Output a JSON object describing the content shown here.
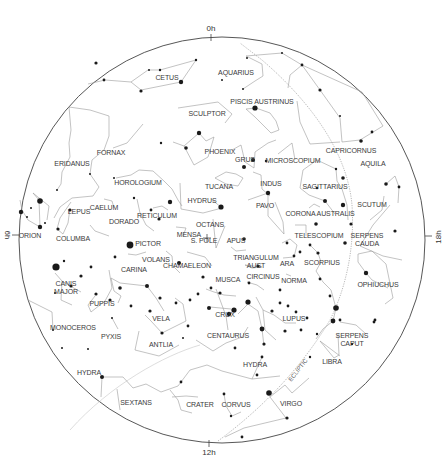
{
  "chart": {
    "center_marker": "S. POLE",
    "hour_labels": {
      "top": "0h",
      "right": "18h",
      "bottom": "12h",
      "left": "6h"
    },
    "ecliptic_label": "ECLIPTIC",
    "colors": {
      "line": "#9a9a9a",
      "star": "#1a1a1a",
      "border": "#444444",
      "text": "#3a3a3a"
    }
  },
  "constellations": [
    {
      "name": "CETUS",
      "x": 167,
      "y": 78
    },
    {
      "name": "AQUARIUS",
      "x": 236,
      "y": 73
    },
    {
      "name": "CAPRICORNUS",
      "x": 351,
      "y": 151
    },
    {
      "name": "PISCIS AUSTRINUS",
      "x": 262,
      "y": 102
    },
    {
      "name": "SCULPTOR",
      "x": 207,
      "y": 114
    },
    {
      "name": "FORNAX",
      "x": 111,
      "y": 153
    },
    {
      "name": "PHOENIX",
      "x": 220,
      "y": 152
    },
    {
      "name": "GRUS",
      "x": 245,
      "y": 160
    },
    {
      "name": "MICROSCOPIUM",
      "x": 293,
      "y": 161
    },
    {
      "name": "AQUILA",
      "x": 373,
      "y": 164
    },
    {
      "name": "ERIDANUS",
      "x": 72,
      "y": 164
    },
    {
      "name": "HOROLOGIUM",
      "x": 138,
      "y": 183
    },
    {
      "name": "TUCANA",
      "x": 219,
      "y": 187
    },
    {
      "name": "INDUS",
      "x": 271,
      "y": 184
    },
    {
      "name": "SAGITTARIUS",
      "x": 325,
      "y": 187
    },
    {
      "name": "SCUTUM",
      "x": 372,
      "y": 205
    },
    {
      "name": "CAELUM",
      "x": 104,
      "y": 208
    },
    {
      "name": "LEPUS",
      "x": 79,
      "y": 212
    },
    {
      "name": "HYDRUS",
      "x": 202,
      "y": 201
    },
    {
      "name": "PAVO",
      "x": 265,
      "y": 206
    },
    {
      "name": "RETICULUM",
      "x": 157,
      "y": 216
    },
    {
      "name": "CORONA AUSTRALIS",
      "x": 320,
      "y": 214
    },
    {
      "name": "DORADO",
      "x": 124,
      "y": 222
    },
    {
      "name": "OCTANS",
      "x": 210,
      "y": 225
    },
    {
      "name": "MENSA",
      "x": 189,
      "y": 235
    },
    {
      "name": "S. POLE",
      "x": 204,
      "y": 241
    },
    {
      "name": "ORION",
      "x": 30,
      "y": 236
    },
    {
      "name": "COLUMBA",
      "x": 73,
      "y": 239
    },
    {
      "name": "APUS",
      "x": 236,
      "y": 241
    },
    {
      "name": "TELESCOPIUM",
      "x": 319,
      "y": 236
    },
    {
      "name": "SERPENS\nCAUDA",
      "x": 367,
      "y": 240
    },
    {
      "name": "PICTOR",
      "x": 148,
      "y": 244
    },
    {
      "name": "TRIANGULUM\nAUST",
      "x": 256,
      "y": 262
    },
    {
      "name": "ARA",
      "x": 287,
      "y": 264
    },
    {
      "name": "SCORPIUS",
      "x": 322,
      "y": 263
    },
    {
      "name": "VOLANS",
      "x": 156,
      "y": 260
    },
    {
      "name": "CHAMAELEON",
      "x": 187,
      "y": 266
    },
    {
      "name": "CARINA",
      "x": 134,
      "y": 270
    },
    {
      "name": "CIRCINUS",
      "x": 263,
      "y": 277
    },
    {
      "name": "NORMA",
      "x": 294,
      "y": 281
    },
    {
      "name": "CANIS\nMAJOR",
      "x": 66,
      "y": 288
    },
    {
      "name": "PUPPIS",
      "x": 102,
      "y": 304
    },
    {
      "name": "MUSCA",
      "x": 228,
      "y": 280
    },
    {
      "name": "OPHIUCHUS",
      "x": 378,
      "y": 285
    },
    {
      "name": "CRUX",
      "x": 225,
      "y": 315
    },
    {
      "name": "LUPUS",
      "x": 294,
      "y": 319
    },
    {
      "name": "VELA",
      "x": 161,
      "y": 319
    },
    {
      "name": "CENTAURUS",
      "x": 228,
      "y": 336
    },
    {
      "name": "MONOCEROS",
      "x": 73,
      "y": 328
    },
    {
      "name": "PYXIS",
      "x": 111,
      "y": 337
    },
    {
      "name": "ANTLIA",
      "x": 161,
      "y": 345
    },
    {
      "name": "SERPENS\nCAPUT",
      "x": 352,
      "y": 340
    },
    {
      "name": "HYDRA",
      "x": 89,
      "y": 373
    },
    {
      "name": "HYDRA",
      "x": 255,
      "y": 365
    },
    {
      "name": "LIBRA",
      "x": 332,
      "y": 362
    },
    {
      "name": "SEXTANS",
      "x": 136,
      "y": 403
    },
    {
      "name": "CRATER",
      "x": 200,
      "y": 405
    },
    {
      "name": "CORVUS",
      "x": 236,
      "y": 405
    },
    {
      "name": "VIRGO",
      "x": 291,
      "y": 404
    }
  ]
}
